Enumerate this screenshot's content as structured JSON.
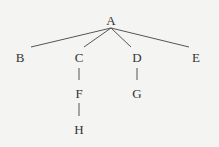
{
  "tree": {
    "nodes": [
      {
        "id": "A",
        "label": "A",
        "x": 111,
        "y": 20
      },
      {
        "id": "B",
        "label": "B",
        "x": 20,
        "y": 57
      },
      {
        "id": "C",
        "label": "C",
        "x": 79,
        "y": 57
      },
      {
        "id": "D",
        "label": "D",
        "x": 137,
        "y": 57
      },
      {
        "id": "E",
        "label": "E",
        "x": 196,
        "y": 57
      },
      {
        "id": "F",
        "label": "F",
        "x": 79,
        "y": 93
      },
      {
        "id": "G",
        "label": "G",
        "x": 137,
        "y": 93
      },
      {
        "id": "H",
        "label": "H",
        "x": 79,
        "y": 129
      }
    ],
    "edges": [
      [
        "A",
        "B"
      ],
      [
        "A",
        "C"
      ],
      [
        "A",
        "D"
      ],
      [
        "A",
        "E"
      ],
      [
        "C",
        "F"
      ],
      [
        "D",
        "G"
      ],
      [
        "F",
        "H"
      ]
    ],
    "line_color": "#555555"
  }
}
